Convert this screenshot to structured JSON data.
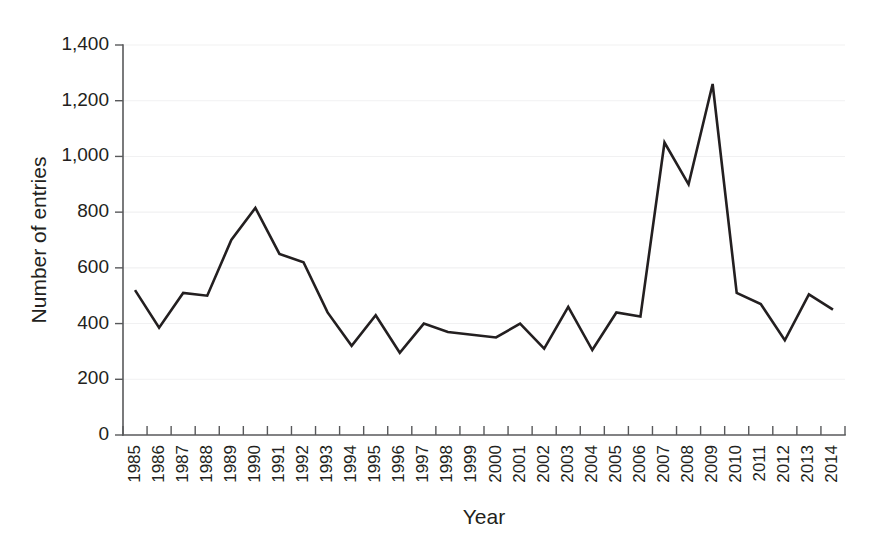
{
  "chart_data": {
    "type": "line",
    "title": "",
    "xlabel": "Year",
    "ylabel": "Number of entries",
    "categories": [
      "1985",
      "1986",
      "1987",
      "1988",
      "1989",
      "1990",
      "1991",
      "1992",
      "1993",
      "1994",
      "1995",
      "1996",
      "1997",
      "1998",
      "1999",
      "2000",
      "2001",
      "2002",
      "2003",
      "2004",
      "2005",
      "2006",
      "2007",
      "2008",
      "2009",
      "2010",
      "2011",
      "2012",
      "2013",
      "2014"
    ],
    "values": [
      520,
      385,
      510,
      500,
      700,
      815,
      650,
      620,
      440,
      320,
      430,
      295,
      400,
      370,
      360,
      350,
      400,
      310,
      460,
      305,
      440,
      425,
      1050,
      900,
      1260,
      510,
      470,
      340,
      505,
      450
    ],
    "series": [
      {
        "name": "Number of entries",
        "values": [
          520,
          385,
          510,
          500,
          700,
          815,
          650,
          620,
          440,
          320,
          430,
          295,
          400,
          370,
          360,
          350,
          400,
          310,
          460,
          305,
          440,
          425,
          1050,
          900,
          1260,
          510,
          470,
          340,
          505,
          450
        ]
      }
    ],
    "ylim": [
      0,
      1400
    ],
    "yticks": [
      0,
      200,
      400,
      600,
      800,
      1000,
      1200,
      1400
    ],
    "ytick_labels": [
      "0",
      "200",
      "400",
      "600",
      "800",
      "1,000",
      "1,200",
      "1,400"
    ],
    "grid": true,
    "grid_axis": "y",
    "legend": false,
    "legend_position": "none",
    "line_color": "#231f20",
    "grid_color": "#f1f1f2",
    "axis_color": "#58595b",
    "background_color": "#ffffff"
  }
}
